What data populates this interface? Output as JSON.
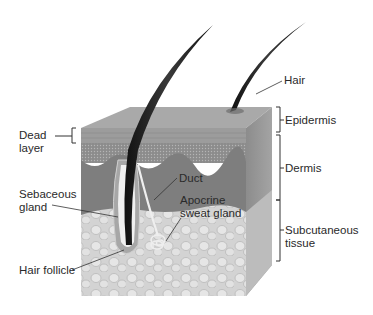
{
  "labels": {
    "hair": "Hair",
    "epidermis": "Epidermis",
    "dermis": "Dermis",
    "subcutaneous": "Subcutaneous\ntissue",
    "dead_layer": "Dead\nlayer",
    "sebaceous_gland": "Sebaceous\ngland",
    "hair_follicle": "Hair follicle",
    "duct": "Duct",
    "apocrine_sweat_gland": "Apocrine\nsweat gland"
  },
  "colors": {
    "top_face": "#a8a8a8",
    "dead_layer": "#9a9a9a",
    "epidermis_front": "#8e8e8e",
    "dermis": "#7f7f7f",
    "subcutaneous": "#cfcfcf",
    "side_face": "#8a8a8a",
    "hair": "#1c1c1c",
    "leader": "#333333"
  }
}
